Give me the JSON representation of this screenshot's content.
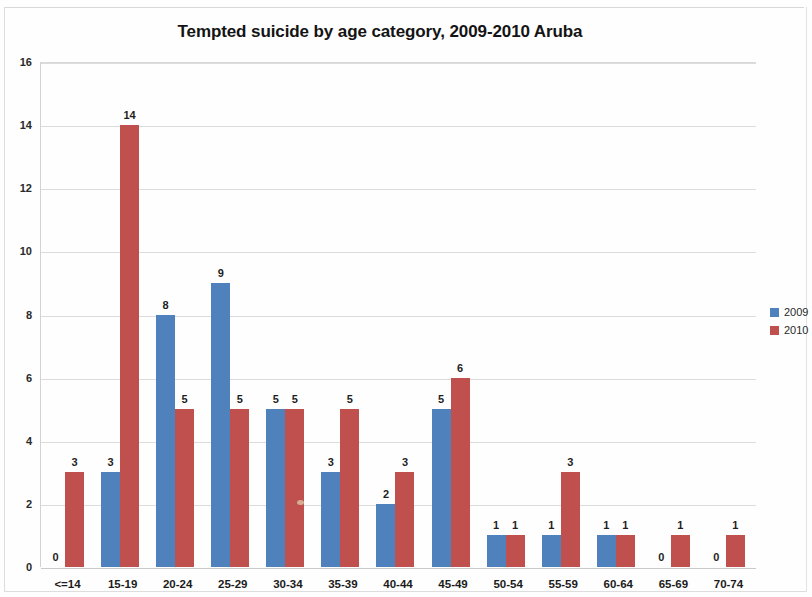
{
  "chart_data": {
    "type": "bar",
    "title": "Tempted suicide by age category, 2009-2010 Aruba",
    "xlabel": "",
    "ylabel": "",
    "categories": [
      "<=14",
      "15-19",
      "20-24",
      "25-29",
      "30-34",
      "35-39",
      "40-44",
      "45-49",
      "50-54",
      "55-59",
      "60-64",
      "65-69",
      "70-74"
    ],
    "series": [
      {
        "name": "2009",
        "color": "#4f81bd",
        "values": [
          0,
          3,
          8,
          9,
          5,
          3,
          2,
          5,
          1,
          1,
          1,
          0,
          0
        ]
      },
      {
        "name": "2010",
        "color": "#c0504d",
        "values": [
          3,
          14,
          5,
          5,
          5,
          5,
          3,
          6,
          1,
          3,
          1,
          1,
          1
        ]
      }
    ],
    "ylim": [
      0,
      16
    ],
    "yticks": [
      0,
      2,
      4,
      6,
      8,
      10,
      12,
      14,
      16
    ],
    "ytick_labels": [
      "0",
      "2",
      "4",
      "6",
      "8",
      "10",
      "12",
      "14",
      "16"
    ],
    "grid": true,
    "grid_axis": "y",
    "data_labels": true,
    "legend": {
      "position": "right",
      "entries": [
        "2009",
        "2010"
      ]
    }
  }
}
